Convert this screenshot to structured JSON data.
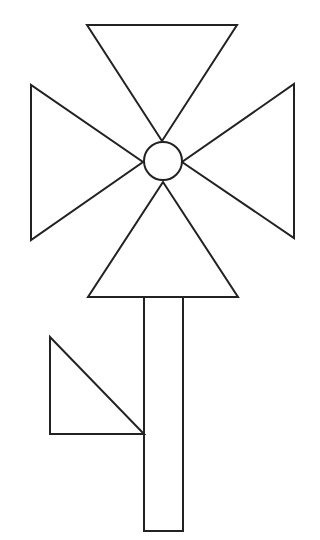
{
  "diagram": {
    "colors": {
      "stroke": "#222222",
      "fill": "#ffffff",
      "background": "#ffffff"
    },
    "shapes": {
      "petal_top": {
        "type": "triangle",
        "points": "87,25 237,25 162,141"
      },
      "petal_left": {
        "type": "triangle",
        "points": "31,85 31,240 143,162"
      },
      "petal_right": {
        "type": "triangle",
        "points": "294,84 294,238 182,162"
      },
      "petal_bottom": {
        "type": "triangle",
        "points": "163,182 88,297 238,297"
      },
      "center": {
        "type": "circle",
        "cx": 163,
        "cy": 161,
        "r": 19
      },
      "stem": {
        "type": "rectangle",
        "x": 144,
        "y": 297,
        "width": 39,
        "height": 234
      },
      "leaf": {
        "type": "triangle",
        "points": "50,337 50,434 144,434"
      }
    }
  }
}
